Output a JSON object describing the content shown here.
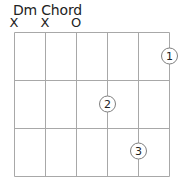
{
  "diagram": {
    "title": "Dm Chord",
    "string_markers": [
      {
        "string": 6,
        "symbol": "X"
      },
      {
        "string": 5,
        "symbol": "X"
      },
      {
        "string": 4,
        "symbol": "O"
      }
    ],
    "strings": 6,
    "frets": 3,
    "fingers": [
      {
        "label": "1",
        "string": 1,
        "fret": 1
      },
      {
        "label": "2",
        "string": 3,
        "fret": 2
      },
      {
        "label": "3",
        "string": 2,
        "fret": 3
      }
    ],
    "colors": {
      "line": "#a0a0a0",
      "text": "#222222",
      "circle_stroke": "#808080"
    }
  }
}
